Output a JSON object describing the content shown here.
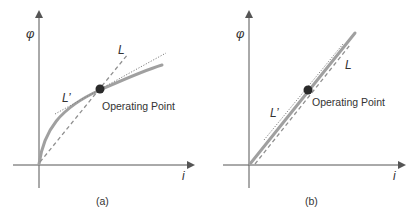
{
  "figure": {
    "panels": [
      {
        "id": "a",
        "caption": "(a)",
        "y_axis_label": "φ",
        "x_axis_label": "i",
        "curve_type": "saturating (nonlinear)",
        "operating_point_label": "Operating Point",
        "secant_label": "L",
        "tangent_label": "L’"
      },
      {
        "id": "b",
        "caption": "(b)",
        "y_axis_label": "φ",
        "x_axis_label": "i",
        "curve_type": "linear",
        "operating_point_label": "Operating Point",
        "secant_label": "L",
        "tangent_label": "L’"
      }
    ]
  },
  "colors": {
    "axis": "#555555",
    "curve": "#a0a0a0",
    "dashed": "#909090",
    "dotted": "#808080",
    "point": "#2a2a2a",
    "text": "#333333"
  }
}
